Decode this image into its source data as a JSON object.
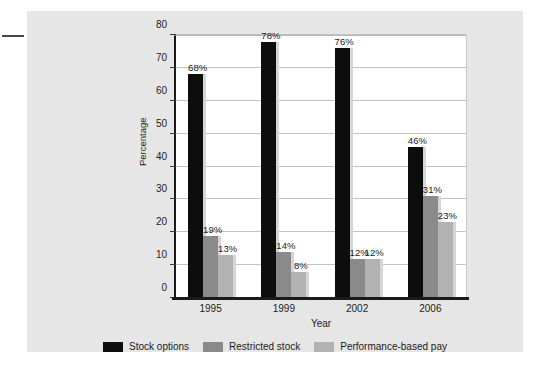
{
  "chart_data": {
    "type": "bar",
    "title": "",
    "xlabel": "Year",
    "ylabel": "Percentage",
    "categories": [
      "1995",
      "1999",
      "2002",
      "2006"
    ],
    "ylim": [
      0,
      80
    ],
    "yticks": [
      0,
      10,
      20,
      30,
      40,
      50,
      60,
      70,
      80
    ],
    "grid": true,
    "legend_position": "bottom",
    "value_suffix": "%",
    "series": [
      {
        "name": "Stock options",
        "color": "#0d0d0d",
        "values": [
          68,
          78,
          76,
          46
        ],
        "labels": [
          "68%",
          "78%",
          "76%",
          "46%"
        ]
      },
      {
        "name": "Restricted stock",
        "color": "#8a8a8a",
        "values": [
          19,
          14,
          12,
          31
        ],
        "labels": [
          "19%",
          "14%",
          "12%",
          "31%"
        ]
      },
      {
        "name": "Performance-based pay",
        "color": "#b2b2b2",
        "values": [
          13,
          8,
          12,
          23
        ],
        "labels": [
          "13%",
          "8%",
          "12%",
          "23%"
        ]
      }
    ]
  },
  "figure": {
    "background": "#e6e6e6",
    "plot_background": "#ffffff"
  }
}
